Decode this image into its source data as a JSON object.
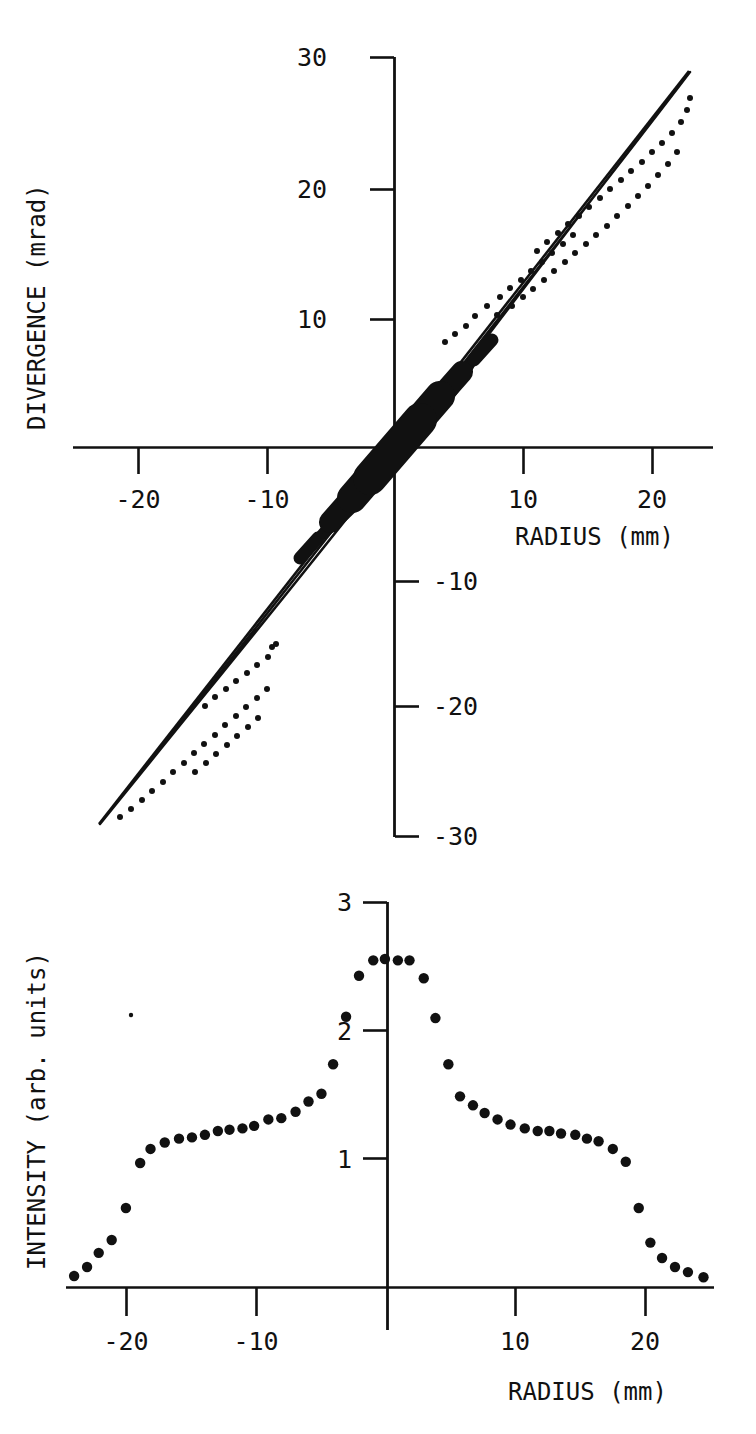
{
  "figure": {
    "background": "#ffffff",
    "ink": "#111111",
    "panels": [
      "phase-space",
      "intensity-profile"
    ]
  },
  "chart_data": [
    {
      "id": "phase-space",
      "type": "scatter",
      "title": "",
      "xlabel": "RADIUS (mm)",
      "ylabel": "DIVERGENCE (mrad)",
      "xlim": [
        -25,
        25
      ],
      "ylim": [
        -30,
        30
      ],
      "xticks": [
        -20,
        -10,
        10,
        20
      ],
      "xticklabels": [
        "-20",
        "-10",
        "10",
        "20"
      ],
      "yticks": [
        -30,
        -20,
        -10,
        10,
        20,
        30
      ],
      "yticklabels": [
        "-30",
        "-20",
        "-10",
        "10",
        "20",
        "30"
      ],
      "grid": false,
      "legend": null,
      "axis_style": "crossed-spines-at-origin",
      "annotations": [
        "Narrow elongated phase-space ellipse through the origin",
        "Dotted outline offset from the solid envelope on both arms",
        "Dense filled (black) core region near the origin"
      ],
      "series": [
        {
          "name": "solid envelope (upper edge)",
          "style": "solid-line",
          "x": [
            -23.0,
            -15.0,
            -8.0,
            -2.0,
            0.0,
            2.0,
            8.0,
            15.0,
            22.7
          ],
          "y": [
            -29.0,
            -18.7,
            -9.6,
            -2.0,
            0.4,
            2.8,
            10.6,
            19.9,
            29.2
          ]
        },
        {
          "name": "solid envelope (lower edge)",
          "style": "solid-line",
          "x": [
            -23.0,
            -15.0,
            -8.0,
            -2.0,
            0.0,
            2.0,
            8.0,
            15.0,
            22.7
          ],
          "y": [
            -29.0,
            -19.8,
            -10.9,
            -3.1,
            -0.6,
            1.8,
            9.5,
            18.8,
            29.2
          ]
        },
        {
          "name": "dotted envelope",
          "style": "dotted-line",
          "x": [
            -20.0,
            -16.0,
            -12.0,
            -8.0,
            -4.0,
            4.0,
            8.0,
            12.0,
            16.0,
            20.0,
            22.5
          ],
          "y": [
            -29.0,
            -24.4,
            -19.6,
            -14.6,
            -9.6,
            13.2,
            18.0,
            22.4,
            26.3,
            28.8,
            29.4
          ]
        },
        {
          "name": "filled core",
          "style": "filled-band",
          "x": [
            -6.0,
            0.0,
            6.0
          ],
          "y": [
            -7.5,
            0.0,
            7.5
          ]
        }
      ]
    },
    {
      "id": "intensity-profile",
      "type": "scatter",
      "title": "",
      "xlabel": "RADIUS (mm)",
      "ylabel": "INTENSITY (arb. units)",
      "xlim": [
        -25,
        25
      ],
      "ylim": [
        0,
        3
      ],
      "xticks": [
        -20,
        -10,
        10,
        20
      ],
      "xticklabels": [
        "-20",
        "-10",
        "10",
        "20"
      ],
      "yticks": [
        1,
        2,
        3
      ],
      "yticklabels": [
        "1",
        "2",
        "3"
      ],
      "grid": false,
      "legend": null,
      "marker": "filled-circle",
      "x": [
        -24.2,
        -23.2,
        -22.3,
        -21.3,
        -20.2,
        -19.1,
        -18.3,
        -17.2,
        -16.1,
        -15.1,
        -14.1,
        -13.1,
        -12.2,
        -11.2,
        -10.3,
        -9.2,
        -8.2,
        -7.1,
        -6.1,
        -5.1,
        -4.2,
        -3.2,
        -2.2,
        -1.1,
        -0.2,
        0.8,
        1.7,
        2.8,
        3.7,
        4.7,
        5.6,
        6.6,
        7.5,
        8.5,
        9.5,
        10.6,
        11.6,
        12.5,
        13.4,
        14.5,
        15.4,
        16.3,
        17.4,
        18.4,
        19.4,
        20.3,
        21.2,
        22.2,
        23.2,
        24.4
      ],
      "y": [
        0.09,
        0.16,
        0.27,
        0.37,
        0.62,
        0.97,
        1.08,
        1.13,
        1.16,
        1.17,
        1.19,
        1.22,
        1.23,
        1.24,
        1.26,
        1.31,
        1.32,
        1.37,
        1.45,
        1.51,
        1.74,
        2.11,
        2.43,
        2.55,
        2.56,
        2.55,
        2.55,
        2.41,
        2.1,
        1.74,
        1.49,
        1.42,
        1.36,
        1.31,
        1.27,
        1.24,
        1.22,
        1.22,
        1.2,
        1.19,
        1.16,
        1.14,
        1.08,
        0.98,
        0.62,
        0.35,
        0.23,
        0.16,
        0.12,
        0.08
      ]
    }
  ],
  "top_panel": {
    "yaxis_label": "DIVERGENCE (mrad)",
    "xaxis_label": "RADIUS (mm)",
    "y_tick_labels": {
      "p30": "30",
      "p20": "20",
      "p10": "10",
      "m10": "-10",
      "m20": "-20",
      "m30": "-30"
    },
    "x_tick_labels": {
      "m20": "-20",
      "m10": "-10",
      "p10": "10",
      "p20": "20"
    }
  },
  "bottom_panel": {
    "yaxis_label": "INTENSITY (arb. units)",
    "xaxis_label": "RADIUS (mm)",
    "y_tick_labels": {
      "p3": "3",
      "p2": "2",
      "p1": "1"
    },
    "x_tick_labels": {
      "m20": "-20",
      "m10": "-10",
      "p10": "10",
      "p20": "20"
    }
  }
}
